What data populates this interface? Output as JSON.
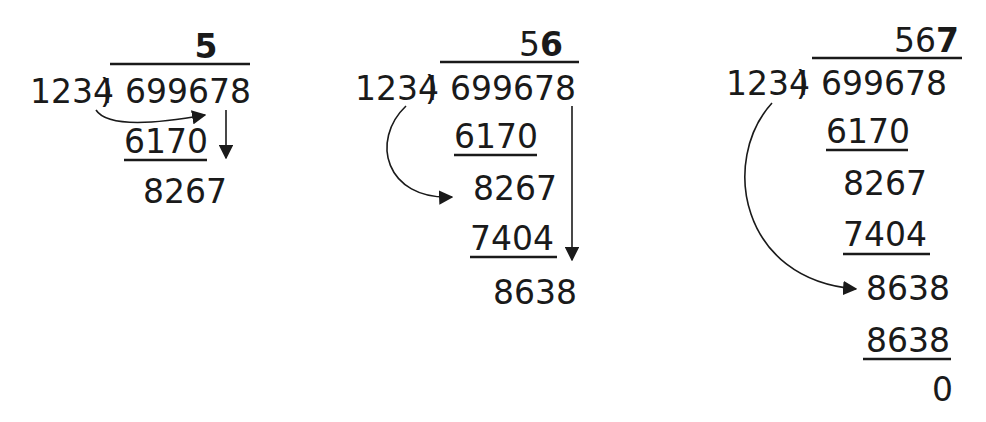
{
  "diagram": {
    "type": "long-division-steps",
    "divisor": "1234",
    "dividend": "699678",
    "final_quotient": "567",
    "steps": [
      {
        "quotient_normal": "",
        "quotient_bold": "5",
        "rows": [
          {
            "value": "6170",
            "underlined": true
          },
          {
            "value": "8267",
            "underlined": false
          }
        ]
      },
      {
        "quotient_normal": "5",
        "quotient_bold": "6",
        "rows": [
          {
            "value": "6170",
            "underlined": true
          },
          {
            "value": "8267",
            "underlined": false
          },
          {
            "value": "7404",
            "underlined": true
          },
          {
            "value": "8638",
            "underlined": false
          }
        ]
      },
      {
        "quotient_normal": "56",
        "quotient_bold": "7",
        "rows": [
          {
            "value": "6170",
            "underlined": true
          },
          {
            "value": "8267",
            "underlined": false
          },
          {
            "value": "7404",
            "underlined": true
          },
          {
            "value": "8638",
            "underlined": false
          },
          {
            "value": "8638",
            "underlined": true
          },
          {
            "value": "0",
            "underlined": false
          }
        ]
      }
    ]
  }
}
